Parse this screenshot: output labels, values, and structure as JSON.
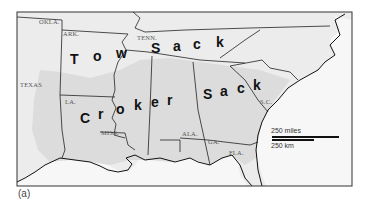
{
  "figure": {
    "caption": "(a)",
    "title_words": [
      "Tow",
      "Sack",
      "Croker",
      "Sack"
    ]
  },
  "map": {
    "colors": {
      "land": "#ececec",
      "shaded_region": "#dcdcdc",
      "water": "#f7f7f7",
      "border": "#222222",
      "frame": "#333333"
    },
    "state_labels": [
      {
        "id": "okla",
        "text": "OKLA.",
        "x": 39,
        "y": 24
      },
      {
        "id": "ark",
        "text": "ARK.",
        "x": 63,
        "y": 36
      },
      {
        "id": "tenn",
        "text": "TENN.",
        "x": 137,
        "y": 40
      },
      {
        "id": "texas",
        "text": "TEXAS",
        "x": 20,
        "y": 87
      },
      {
        "id": "la",
        "text": "LA.",
        "x": 65,
        "y": 104
      },
      {
        "id": "miss",
        "text": "MISS.",
        "x": 101,
        "y": 135
      },
      {
        "id": "ala",
        "text": "ALA.",
        "x": 182,
        "y": 136
      },
      {
        "id": "ga",
        "text": "GA.",
        "x": 208,
        "y": 144
      },
      {
        "id": "fla",
        "text": "FLA.",
        "x": 229,
        "y": 155
      },
      {
        "id": "sc",
        "text": "S.C.",
        "x": 260,
        "y": 104
      }
    ],
    "big_letters": [
      {
        "ch": "T",
        "x": 70,
        "y": 64
      },
      {
        "ch": "o",
        "x": 93,
        "y": 61
      },
      {
        "ch": "w",
        "x": 116,
        "y": 58
      },
      {
        "ch": "S",
        "x": 151,
        "y": 53
      },
      {
        "ch": "a",
        "x": 173,
        "y": 51
      },
      {
        "ch": "c",
        "x": 193,
        "y": 49
      },
      {
        "ch": "k",
        "x": 216,
        "y": 47
      },
      {
        "ch": "C",
        "x": 80,
        "y": 123
      },
      {
        "ch": "r",
        "x": 98,
        "y": 119
      },
      {
        "ch": "o",
        "x": 116,
        "y": 114
      },
      {
        "ch": "k",
        "x": 134,
        "y": 110
      },
      {
        "ch": "e",
        "x": 151,
        "y": 107
      },
      {
        "ch": "r",
        "x": 167,
        "y": 105
      },
      {
        "ch": "S",
        "x": 203,
        "y": 99
      },
      {
        "ch": "a",
        "x": 220,
        "y": 96
      },
      {
        "ch": "c",
        "x": 237,
        "y": 93
      },
      {
        "ch": "k",
        "x": 253,
        "y": 90
      }
    ],
    "scale_bar": {
      "miles_label": "250 miles",
      "km_label": "250 km"
    }
  }
}
